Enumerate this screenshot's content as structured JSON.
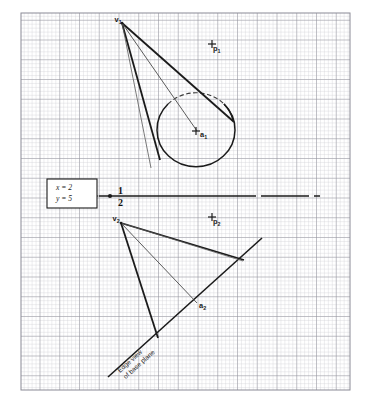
{
  "figure": {
    "paper": {
      "type": "graph-paper",
      "minor_grid_px": 3.95,
      "major_every": 5,
      "minor_color": "#c9c9cf",
      "major_color": "#8f8f99",
      "bounds": {
        "x": 21,
        "y": 13,
        "width": 329,
        "height": 377
      }
    },
    "ink_color": "#1b1b1b",
    "coordinate_box": {
      "name": "coordinate-callout",
      "x_line": "x = 2",
      "y_line": "y = 5",
      "rect": {
        "x": 47,
        "y": 179,
        "width": 50,
        "height": 29
      }
    },
    "fold_line": {
      "label_top": "1",
      "label_bottom": "2",
      "description": "reference / fold line between view 1 and view 2",
      "y": 196,
      "x_start": 99,
      "x_end": 320,
      "arrow_tip_x": 99,
      "origin_dot_x": 110
    },
    "top_view": {
      "name": "top-view",
      "apex_label": "v",
      "apex_sub": "1",
      "apex": {
        "x": 122,
        "y": 23
      },
      "axis_end_label": "a",
      "axis_end_sub": "1",
      "axis_end": {
        "x": 196,
        "y": 131
      },
      "point_label": "p",
      "point_sub": "1",
      "point": {
        "x": 212,
        "y": 44
      },
      "base_circle": {
        "cx": 196,
        "cy": 131,
        "rx": 39,
        "ry": 37
      }
    },
    "front_view": {
      "name": "front-view",
      "apex_label": "v",
      "apex_sub": "2",
      "apex": {
        "x": 121,
        "y": 223
      },
      "axis_end_label": "a",
      "axis_end_sub": "2",
      "axis_end": {
        "x": 196,
        "y": 302
      },
      "point_label": "p",
      "point_sub": "2",
      "point": {
        "x": 212,
        "y": 217
      },
      "base_edge_note_line1": "Edge view",
      "base_edge_note_line2": "of base plane",
      "base_edge": {
        "x1": 108,
        "y1": 377,
        "x2": 262,
        "y2": 238
      }
    }
  }
}
